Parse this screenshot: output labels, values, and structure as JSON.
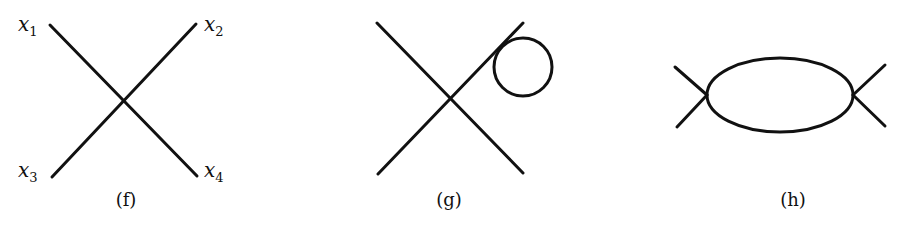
{
  "diagrams": [
    {
      "caption": "(f)",
      "labels": [
        "x",
        "1",
        "x",
        "2",
        "x",
        "3",
        "x",
        "4"
      ]
    },
    {
      "caption": "(g)"
    },
    {
      "caption": "(h)"
    }
  ],
  "colors": {
    "stroke": "#111111",
    "background": "#ffffff"
  }
}
